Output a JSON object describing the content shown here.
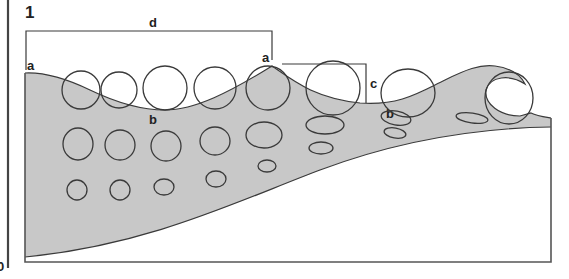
{
  "figure": {
    "number": "1",
    "labels": {
      "wavelength": "d",
      "crest_left": "a",
      "crest_right": "a",
      "trough_left": "b",
      "trough_right": "b",
      "height": "c"
    },
    "cut_off_left_label": "0"
  },
  "colors": {
    "water": "#c8c8c8",
    "lines": "#3a3a3a",
    "frame": "#555555",
    "background": "#ffffff",
    "text": "#222222"
  },
  "orbits": {
    "surface_row": [
      {
        "cx": 81,
        "cy": 90,
        "rx": 19,
        "ry": 19
      },
      {
        "cx": 119,
        "cy": 90,
        "rx": 18,
        "ry": 18
      },
      {
        "cx": 165,
        "cy": 88,
        "rx": 22,
        "ry": 22
      },
      {
        "cx": 215,
        "cy": 88,
        "rx": 21,
        "ry": 21
      },
      {
        "cx": 268,
        "cy": 88,
        "rx": 22,
        "ry": 22
      },
      {
        "cx": 333,
        "cy": 88,
        "rx": 27,
        "ry": 27
      },
      {
        "cx": 408,
        "cy": 93,
        "rx": 27,
        "ry": 24
      },
      {
        "cx": 509,
        "cy": 98,
        "rx": 24,
        "ry": 26
      }
    ],
    "middle_row": [
      {
        "cx": 78,
        "cy": 144,
        "rx": 15,
        "ry": 16
      },
      {
        "cx": 120,
        "cy": 145,
        "rx": 15,
        "ry": 15
      },
      {
        "cx": 166,
        "cy": 146,
        "rx": 15,
        "ry": 15
      },
      {
        "cx": 215,
        "cy": 141,
        "rx": 15,
        "ry": 14
      },
      {
        "cx": 264,
        "cy": 135,
        "rx": 18,
        "ry": 13
      },
      {
        "cx": 325,
        "cy": 125,
        "rx": 19,
        "ry": 9
      },
      {
        "cx": 396,
        "cy": 118,
        "rx": 15,
        "ry": 7
      },
      {
        "cx": 472,
        "cy": 118,
        "rx": 16,
        "ry": 5
      }
    ],
    "deep_row": [
      {
        "cx": 77,
        "cy": 190,
        "rx": 10,
        "ry": 10
      },
      {
        "cx": 120,
        "cy": 190,
        "rx": 10,
        "ry": 10
      },
      {
        "cx": 164,
        "cy": 187,
        "rx": 10,
        "ry": 8
      },
      {
        "cx": 216,
        "cy": 179,
        "rx": 10,
        "ry": 8
      },
      {
        "cx": 267,
        "cy": 166,
        "rx": 9,
        "ry": 6
      },
      {
        "cx": 321,
        "cy": 148,
        "rx": 12,
        "ry": 6
      },
      {
        "cx": 395,
        "cy": 133,
        "rx": 11,
        "ry": 5
      }
    ]
  }
}
